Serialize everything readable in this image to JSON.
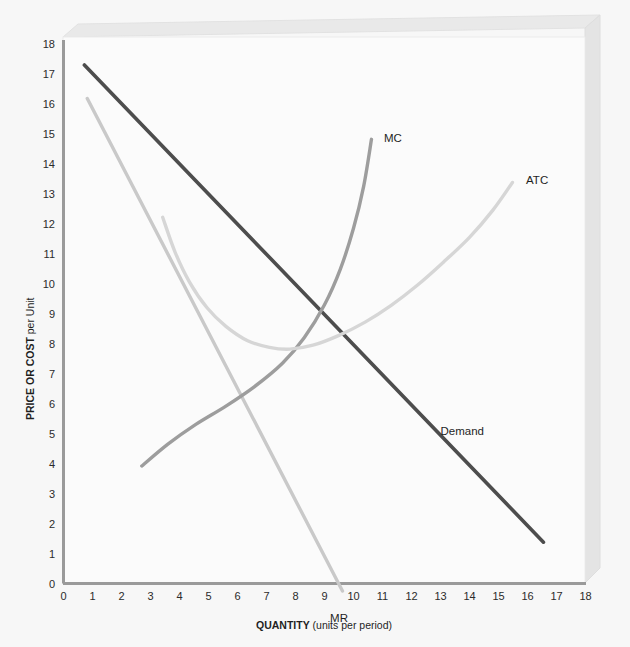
{
  "chart_data": {
    "type": "line",
    "title": "",
    "xlabel_bold": "QUANTITY",
    "xlabel_regular": " (units per period)",
    "ylabel_bold": "PRICE OR COST",
    "ylabel_regular": " per Unit",
    "xlim": [
      0,
      18
    ],
    "ylim": [
      0,
      18
    ],
    "xticks": [
      0,
      1,
      2,
      3,
      4,
      5,
      6,
      7,
      8,
      9,
      10,
      11,
      12,
      13,
      14,
      15,
      16,
      17,
      18
    ],
    "yticks": [
      0,
      1,
      2,
      3,
      4,
      5,
      6,
      7,
      8,
      9,
      10,
      11,
      12,
      13,
      14,
      15,
      16,
      17,
      18
    ],
    "grid": false,
    "legend_position": "inline-curve-labels",
    "series": [
      {
        "name": "Demand",
        "label": "Demand",
        "color": "#4d4d4d",
        "width": 3.6,
        "kind": "straight",
        "label_pos": {
          "x": 13.0,
          "y": 5.1
        },
        "points": [
          {
            "x": 0.72,
            "y": 17.3
          },
          {
            "x": 16.55,
            "y": 1.38
          }
        ]
      },
      {
        "name": "MR",
        "label": "MR",
        "color": "#c9c9c9",
        "width": 3.4,
        "kind": "straight",
        "label_pos": {
          "x": 9.5,
          "y": -1.15
        },
        "points": [
          {
            "x": 0.82,
            "y": 16.18
          },
          {
            "x": 9.62,
            "y": -0.25
          }
        ]
      },
      {
        "name": "MC",
        "label": "MC",
        "color": "#9d9d9d",
        "width": 3.4,
        "kind": "curve",
        "label_pos": {
          "x": 11.05,
          "y": 14.85
        },
        "points": [
          {
            "x": 2.7,
            "y": 3.92
          },
          {
            "x": 3.6,
            "y": 4.65
          },
          {
            "x": 4.55,
            "y": 5.3
          },
          {
            "x": 5.6,
            "y": 5.92
          },
          {
            "x": 6.6,
            "y": 6.58
          },
          {
            "x": 7.55,
            "y": 7.35
          },
          {
            "x": 8.3,
            "y": 8.2
          },
          {
            "x": 9.0,
            "y": 9.3
          },
          {
            "x": 9.55,
            "y": 10.5
          },
          {
            "x": 10.0,
            "y": 11.85
          },
          {
            "x": 10.35,
            "y": 13.25
          },
          {
            "x": 10.62,
            "y": 14.82
          }
        ]
      },
      {
        "name": "ATC",
        "label": "ATC",
        "color": "#d6d6d6",
        "width": 3.4,
        "kind": "curve",
        "label_pos": {
          "x": 15.95,
          "y": 13.45
        },
        "points": [
          {
            "x": 3.42,
            "y": 12.22
          },
          {
            "x": 3.85,
            "y": 11.05
          },
          {
            "x": 4.35,
            "y": 10.05
          },
          {
            "x": 4.95,
            "y": 9.2
          },
          {
            "x": 5.6,
            "y": 8.58
          },
          {
            "x": 6.35,
            "y": 8.1
          },
          {
            "x": 7.1,
            "y": 7.88
          },
          {
            "x": 7.8,
            "y": 7.82
          },
          {
            "x": 8.6,
            "y": 7.95
          },
          {
            "x": 9.5,
            "y": 8.28
          },
          {
            "x": 10.4,
            "y": 8.72
          },
          {
            "x": 11.3,
            "y": 9.28
          },
          {
            "x": 12.2,
            "y": 9.95
          },
          {
            "x": 13.1,
            "y": 10.72
          },
          {
            "x": 14.0,
            "y": 11.55
          },
          {
            "x": 14.8,
            "y": 12.45
          },
          {
            "x": 15.48,
            "y": 13.38
          }
        ]
      }
    ]
  },
  "colors": {
    "page_background": "#f7f7f7",
    "plot_background": "#fbfbfb",
    "frame_face": "#e9e9e9",
    "frame_edge": "#dcdcdc",
    "axis_line": "#9a9a9a",
    "tick_text": "#2b2b2b"
  }
}
